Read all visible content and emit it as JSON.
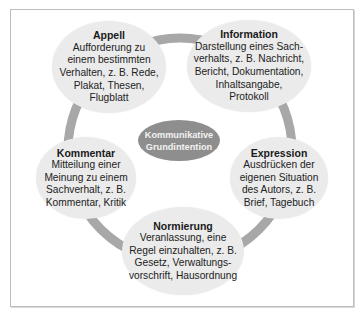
{
  "diagram": {
    "center": {
      "label": "Kommunikative\nGrundintention",
      "color": "#8e8e8e"
    },
    "ring_color": "#a8a8a8",
    "node_color": "#ebebeb",
    "nodes": [
      {
        "id": "appell",
        "title": "Appell",
        "description": "Aufforderung zu\neinem bestimmten\nVerhalten, z. B. Rede,\nPlakat, Thesen,\nFlugblatt"
      },
      {
        "id": "information",
        "title": "Information",
        "description": "Darstellung eines Sach-\nverhalts, z. B. Nachricht,\nBericht, Dokumentation,\nInhaltsangabe,\nProtokoll"
      },
      {
        "id": "expression",
        "title": "Expression",
        "description": "Ausdrücken der\neigenen Situation\ndes Autors, z. B.\nBrief, Tagebuch"
      },
      {
        "id": "normierung",
        "title": "Normierung",
        "description": "Veranlassung, eine\nRegel einzuhalten, z. B.\nGesetz, Verwaltungs-\nvorschrift, Hausordnung"
      },
      {
        "id": "kommentar",
        "title": "Kommentar",
        "description": "Mitteilung einer\nMeinung zu einem\nSachverhalt, z. B.\nKommentar, Kritik"
      }
    ]
  }
}
